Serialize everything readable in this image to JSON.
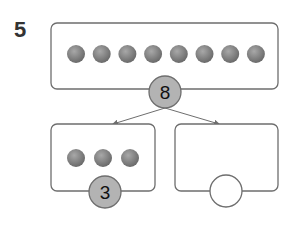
{
  "question": {
    "number": "5"
  },
  "whole": {
    "count": 8,
    "label": "8"
  },
  "part_left": {
    "count": 3,
    "label": "3"
  },
  "part_right": {
    "count": null,
    "label": ""
  },
  "colors": {
    "box_stroke": "#6e6e6e",
    "ball": "#7a7a7a",
    "ball_highlight": "#a8a8a8",
    "number_circle_fill": "#b3b3b3",
    "arrow": "#6e6e6e"
  }
}
